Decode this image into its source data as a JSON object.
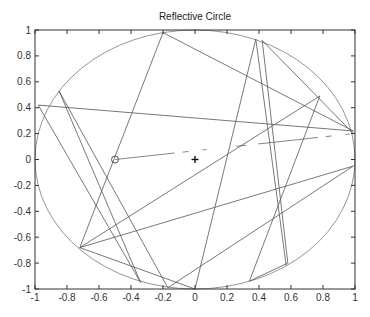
{
  "chart_data": {
    "type": "line",
    "title": "Reflective Circle",
    "xlabel": "",
    "ylabel": "",
    "xlim": [
      -1,
      1
    ],
    "ylim": [
      -1,
      1
    ],
    "grid": false,
    "legend": null,
    "x_ticks": [
      "-1",
      "-0.8",
      "-0.6",
      "-0.4",
      "-0.2",
      "0",
      "0.2",
      "0.4",
      "0.6",
      "0.8",
      "1"
    ],
    "y_ticks": [
      "1",
      "0.8",
      "0.6",
      "0.4",
      "0.2",
      "0",
      "-0.2",
      "-0.4",
      "-0.6",
      "-0.8",
      "-1"
    ],
    "series": [
      {
        "name": "boundary circle",
        "shape": "circle",
        "center": [
          0,
          0
        ],
        "radius": 1,
        "color": "#888888"
      },
      {
        "name": "reflection path",
        "color": "#555555",
        "points": [
          [
            -0.5,
            0.0
          ],
          [
            0.99,
            0.2
          ],
          [
            0.42,
            0.92
          ],
          [
            0.58,
            -0.8
          ],
          [
            0.34,
            -0.94
          ],
          [
            0.78,
            0.49
          ],
          [
            -0.72,
            -0.68
          ],
          [
            0.99,
            -0.05
          ],
          [
            -0.17,
            -0.99
          ],
          [
            -0.85,
            0.53
          ],
          [
            -0.34,
            -0.95
          ],
          [
            -0.98,
            0.42
          ],
          [
            0.99,
            0.22
          ],
          [
            -0.2,
            0.98
          ],
          [
            -0.72,
            -0.68
          ],
          [
            0.0,
            -1.0
          ],
          [
            0.38,
            0.93
          ],
          [
            0.57,
            -0.82
          ]
        ]
      }
    ],
    "markers": [
      {
        "name": "start",
        "symbol": "circle",
        "x": -0.5,
        "y": 0.0
      },
      {
        "name": "center",
        "symbol": "plus",
        "x": 0.0,
        "y": 0.0
      }
    ]
  }
}
